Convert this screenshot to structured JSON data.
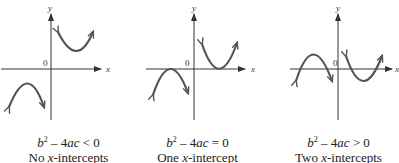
{
  "panels": [
    {
      "id": "no-intercepts",
      "x_label": "x",
      "y_label": "y",
      "origin_label": "0",
      "condition": {
        "lhs_b": "b",
        "exp": "2",
        "mid": " – 4",
        "ac": "ac",
        "rel": " < 0"
      },
      "description": {
        "pre": "No ",
        "x": "x",
        "post": "-intercepts"
      }
    },
    {
      "id": "one-intercept",
      "x_label": "x",
      "y_label": "y",
      "origin_label": "0",
      "condition": {
        "lhs_b": "b",
        "exp": "2",
        "mid": " – 4",
        "ac": "ac",
        "rel": " = 0"
      },
      "description": {
        "pre": "One ",
        "x": "x",
        "post": "-intercept"
      }
    },
    {
      "id": "two-intercepts",
      "x_label": "x",
      "y_label": "y",
      "origin_label": "0",
      "condition": {
        "lhs_b": "b",
        "exp": "2",
        "mid": " – 4",
        "ac": "ac",
        "rel": " > 0"
      },
      "description": {
        "pre": "Two ",
        "x": "x",
        "post": "-intercepts"
      }
    }
  ],
  "colors": {
    "axis": "#333333",
    "curve": "#555555"
  }
}
